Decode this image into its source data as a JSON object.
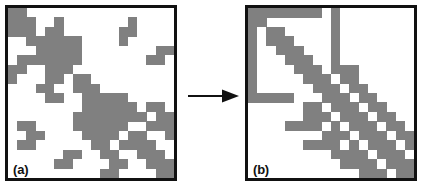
{
  "figure": {
    "caption_a": "(a)",
    "caption_b": "(b)",
    "arrow_name": "right-arrow",
    "colors": {
      "cell_fill": "#808080",
      "background": "#ffffff",
      "border": "#111111",
      "arrow": "#111111"
    }
  },
  "chart_data": {
    "type": "heatmap",
    "title": "",
    "subtitle": "",
    "xlabel": "",
    "ylabel": "",
    "grid": false,
    "legend": null,
    "value_labels": {
      "0": "empty",
      "1": "nonzero"
    },
    "color_scale": {
      "0": "#ffffff",
      "1": "#808080"
    },
    "n_rows": 18,
    "n_cols": 18,
    "panels": [
      {
        "id": "a",
        "label": "(a)",
        "nonzero_count": 92,
        "matrix": [
          [
            1,
            1,
            0,
            0,
            0,
            0,
            0,
            0,
            0,
            0,
            0,
            0,
            0,
            0,
            0,
            0,
            0,
            0
          ],
          [
            1,
            1,
            1,
            0,
            0,
            1,
            0,
            0,
            0,
            0,
            0,
            0,
            0,
            1,
            0,
            0,
            0,
            0
          ],
          [
            1,
            1,
            1,
            0,
            1,
            1,
            0,
            0,
            0,
            0,
            0,
            0,
            1,
            1,
            0,
            0,
            0,
            0
          ],
          [
            0,
            0,
            1,
            1,
            1,
            1,
            1,
            1,
            0,
            0,
            0,
            0,
            1,
            0,
            0,
            0,
            0,
            0
          ],
          [
            0,
            0,
            0,
            1,
            1,
            1,
            1,
            1,
            0,
            0,
            0,
            0,
            0,
            0,
            0,
            0,
            1,
            1
          ],
          [
            0,
            1,
            1,
            1,
            1,
            1,
            1,
            1,
            0,
            0,
            0,
            0,
            0,
            0,
            0,
            1,
            1,
            0
          ],
          [
            1,
            1,
            0,
            0,
            1,
            1,
            1,
            0,
            0,
            0,
            0,
            0,
            0,
            0,
            0,
            0,
            0,
            0
          ],
          [
            1,
            0,
            0,
            0,
            1,
            1,
            0,
            1,
            1,
            0,
            0,
            0,
            0,
            0,
            0,
            0,
            0,
            0
          ],
          [
            0,
            0,
            0,
            1,
            1,
            0,
            0,
            1,
            1,
            1,
            0,
            0,
            0,
            0,
            0,
            0,
            0,
            0
          ],
          [
            0,
            0,
            0,
            0,
            1,
            1,
            0,
            0,
            1,
            1,
            1,
            1,
            1,
            0,
            0,
            0,
            0,
            0
          ],
          [
            0,
            0,
            0,
            0,
            0,
            0,
            0,
            0,
            1,
            1,
            1,
            1,
            1,
            1,
            0,
            1,
            1,
            0
          ],
          [
            0,
            0,
            0,
            0,
            0,
            0,
            0,
            1,
            1,
            1,
            1,
            1,
            1,
            1,
            1,
            0,
            1,
            1
          ],
          [
            0,
            1,
            1,
            0,
            0,
            0,
            0,
            1,
            1,
            1,
            1,
            1,
            1,
            0,
            0,
            1,
            1,
            1
          ],
          [
            0,
            0,
            1,
            1,
            0,
            0,
            0,
            0,
            1,
            1,
            1,
            1,
            0,
            1,
            1,
            0,
            0,
            1
          ],
          [
            0,
            1,
            1,
            0,
            0,
            0,
            0,
            0,
            0,
            1,
            1,
            0,
            1,
            1,
            1,
            1,
            0,
            0
          ],
          [
            0,
            0,
            0,
            0,
            0,
            0,
            1,
            1,
            0,
            0,
            1,
            1,
            0,
            0,
            1,
            1,
            1,
            0
          ],
          [
            0,
            0,
            0,
            0,
            0,
            1,
            1,
            0,
            0,
            0,
            0,
            1,
            1,
            0,
            0,
            1,
            1,
            1
          ],
          [
            0,
            0,
            0,
            0,
            0,
            0,
            0,
            0,
            0,
            0,
            1,
            1,
            0,
            0,
            0,
            0,
            1,
            1
          ]
        ]
      },
      {
        "id": "b",
        "label": "(b)",
        "nonzero_count": 92,
        "matrix": [
          [
            1,
            1,
            1,
            1,
            1,
            1,
            1,
            1,
            0,
            1,
            0,
            0,
            0,
            0,
            0,
            0,
            0,
            0
          ],
          [
            1,
            1,
            0,
            0,
            0,
            0,
            0,
            0,
            0,
            1,
            0,
            0,
            0,
            0,
            0,
            0,
            0,
            0
          ],
          [
            1,
            0,
            1,
            1,
            0,
            0,
            0,
            0,
            0,
            1,
            0,
            0,
            0,
            0,
            0,
            0,
            0,
            0
          ],
          [
            1,
            0,
            1,
            1,
            1,
            0,
            0,
            0,
            0,
            1,
            0,
            0,
            0,
            0,
            0,
            0,
            0,
            0
          ],
          [
            1,
            0,
            0,
            1,
            1,
            1,
            0,
            0,
            0,
            1,
            0,
            0,
            0,
            0,
            0,
            0,
            0,
            0
          ],
          [
            1,
            0,
            0,
            0,
            1,
            1,
            1,
            0,
            0,
            1,
            0,
            0,
            0,
            0,
            0,
            0,
            0,
            0
          ],
          [
            1,
            0,
            0,
            0,
            0,
            1,
            1,
            1,
            0,
            1,
            1,
            1,
            0,
            0,
            0,
            0,
            0,
            0
          ],
          [
            1,
            0,
            0,
            0,
            0,
            0,
            1,
            1,
            1,
            0,
            1,
            1,
            0,
            0,
            0,
            0,
            0,
            0
          ],
          [
            1,
            0,
            0,
            0,
            0,
            0,
            0,
            1,
            1,
            1,
            0,
            1,
            1,
            0,
            0,
            0,
            0,
            0
          ],
          [
            1,
            1,
            1,
            1,
            1,
            0,
            0,
            0,
            1,
            1,
            1,
            0,
            1,
            1,
            0,
            0,
            0,
            0
          ],
          [
            0,
            0,
            0,
            0,
            0,
            0,
            1,
            1,
            0,
            1,
            1,
            1,
            0,
            1,
            1,
            0,
            0,
            0
          ],
          [
            0,
            0,
            0,
            0,
            0,
            0,
            1,
            1,
            1,
            0,
            1,
            1,
            1,
            0,
            1,
            1,
            0,
            0
          ],
          [
            0,
            0,
            0,
            0,
            1,
            1,
            1,
            1,
            0,
            1,
            0,
            1,
            1,
            1,
            0,
            1,
            1,
            0
          ],
          [
            0,
            0,
            0,
            0,
            0,
            0,
            0,
            0,
            1,
            1,
            1,
            0,
            1,
            1,
            1,
            0,
            1,
            1
          ],
          [
            0,
            0,
            0,
            0,
            0,
            0,
            1,
            1,
            1,
            1,
            0,
            1,
            0,
            1,
            1,
            1,
            0,
            1
          ],
          [
            0,
            0,
            0,
            0,
            0,
            0,
            0,
            0,
            0,
            1,
            1,
            1,
            1,
            0,
            1,
            1,
            1,
            0
          ],
          [
            0,
            0,
            0,
            0,
            0,
            0,
            0,
            0,
            0,
            0,
            1,
            1,
            1,
            1,
            0,
            1,
            1,
            1
          ],
          [
            0,
            0,
            0,
            0,
            0,
            0,
            0,
            0,
            0,
            0,
            0,
            0,
            1,
            1,
            1,
            0,
            1,
            1
          ]
        ]
      }
    ]
  }
}
